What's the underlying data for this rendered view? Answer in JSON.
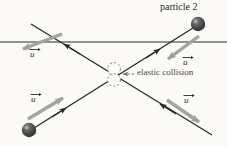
{
  "figure": {
    "background_color": "#fbfaf7",
    "line_color": "#2b2b2b",
    "arrow_color": "#9a9a9a",
    "sphere_color": "#4a4a4a",
    "text_color": "#3a3a3a"
  },
  "labels": {
    "particle2": "particle 2",
    "collision": "elastic collision",
    "u_top_left": "u",
    "u_top_right": "u",
    "u_bottom_left": "u",
    "u_bottom_right": "u"
  },
  "elements": {
    "horizontal_line_name": "reference-axis-line",
    "trajectory_a_name": "trajectory-line-ascending",
    "trajectory_b_name": "trajectory-line-descending",
    "collision_marker_name": "collision-dashed-circles",
    "sphere_top_right_name": "particle-2-sphere",
    "sphere_bottom_left_name": "particle-1-sphere"
  },
  "geometry": {
    "horizontal_line_y": 42,
    "collision_point": [
      114,
      74
    ],
    "sphere_top_right": [
      198,
      24
    ],
    "sphere_bottom_left": [
      29,
      130
    ]
  }
}
